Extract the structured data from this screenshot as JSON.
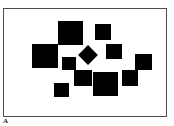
{
  "figure": {
    "canvas": {
      "width": 174,
      "height": 126,
      "background": "#ffffff"
    },
    "frame": {
      "label": "plot-frame",
      "x": 3,
      "y": 8,
      "width": 164,
      "height": 109,
      "border_color": "#4d4d4d",
      "border_width": 1,
      "fill": "#ffffff"
    },
    "corner_mark": {
      "text": "A",
      "x": 3,
      "y": 118,
      "color": "#1a1a1a"
    }
  },
  "chart_data": {
    "type": "scatter",
    "title": "",
    "subtitle": "",
    "xlabel": "",
    "ylabel": "",
    "xlim": [
      3,
      167
    ],
    "ylim": [
      8,
      117
    ],
    "grid": false,
    "legend": null,
    "tick_labels": {
      "x": [],
      "y": []
    },
    "annotations": [
      "A"
    ],
    "marker_color": "#000000",
    "marker_count": 12,
    "markers": [
      {
        "id": "m1",
        "name": "square-top-center-large",
        "shape": "square",
        "x": 58,
        "y": 21,
        "width": 25,
        "height": 24,
        "rotation": 0,
        "color": "#000000"
      },
      {
        "id": "m2",
        "name": "square-top-right-small",
        "shape": "square",
        "x": 95,
        "y": 24,
        "width": 16,
        "height": 16,
        "rotation": 0,
        "color": "#000000"
      },
      {
        "id": "m3",
        "name": "square-mid-left-large",
        "shape": "square",
        "x": 32,
        "y": 44,
        "width": 26,
        "height": 24,
        "rotation": 0,
        "color": "#000000"
      },
      {
        "id": "m4",
        "name": "square-mid-right-medium",
        "shape": "square",
        "x": 106,
        "y": 44,
        "width": 16,
        "height": 15,
        "rotation": 0,
        "color": "#000000"
      },
      {
        "id": "m5",
        "name": "diamond-center",
        "shape": "diamond",
        "x": 81,
        "y": 48,
        "width": 14,
        "height": 14,
        "rotation": 45,
        "color": "#000000"
      },
      {
        "id": "m6",
        "name": "square-center-small",
        "shape": "square",
        "x": 62,
        "y": 57,
        "width": 14,
        "height": 13,
        "rotation": 0,
        "color": "#000000"
      },
      {
        "id": "m7",
        "name": "square-far-right-medium",
        "shape": "square",
        "x": 135,
        "y": 54,
        "width": 17,
        "height": 16,
        "rotation": 0,
        "color": "#000000"
      },
      {
        "id": "m8",
        "name": "square-lower-mid",
        "shape": "square",
        "x": 74,
        "y": 70,
        "width": 18,
        "height": 16,
        "rotation": 0,
        "color": "#000000"
      },
      {
        "id": "m9",
        "name": "square-bottom-center-large",
        "shape": "square",
        "x": 93,
        "y": 72,
        "width": 25,
        "height": 24,
        "rotation": 0,
        "color": "#000000"
      },
      {
        "id": "m10",
        "name": "square-right-lower",
        "shape": "square",
        "x": 122,
        "y": 70,
        "width": 16,
        "height": 16,
        "rotation": 0,
        "color": "#000000"
      },
      {
        "id": "m11",
        "name": "square-bottom-left-small",
        "shape": "square",
        "x": 54,
        "y": 83,
        "width": 15,
        "height": 14,
        "rotation": 0,
        "color": "#000000"
      },
      {
        "id": "m12",
        "name": "square-upper-left-tiny",
        "shape": "square",
        "x": 47,
        "y": 63,
        "width": 0,
        "height": 0,
        "rotation": 0,
        "color": "#000000"
      }
    ]
  }
}
